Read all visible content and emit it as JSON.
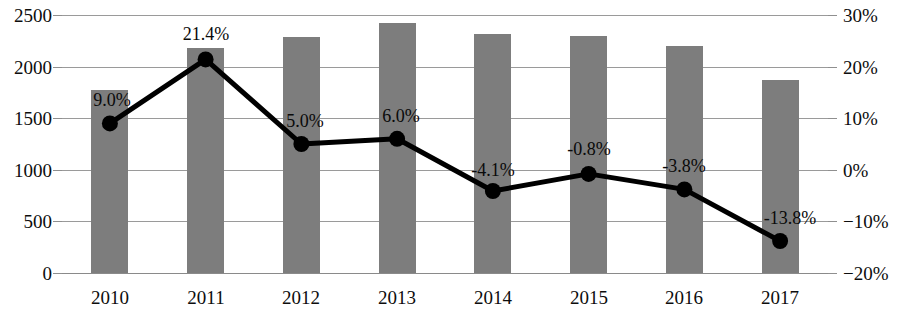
{
  "chart_data": {
    "type": "bar",
    "title": "",
    "subtitle": "",
    "xlabel": "",
    "ylabel": "",
    "y2label": "",
    "grid": true,
    "legend": "none",
    "categories": [
      "2010",
      "2011",
      "2012",
      "2013",
      "2014",
      "2015",
      "2016",
      "2017"
    ],
    "series": [
      {
        "name": "Amount",
        "type": "bar",
        "axis": "left",
        "color": "#7d7d7d",
        "values": [
          1769,
          2183,
          2288,
          2423,
          2317,
          2298,
          2202,
          1875
        ]
      },
      {
        "name": "Growth rate",
        "type": "line",
        "axis": "right",
        "color": "#000000",
        "values": [
          9.0,
          21.4,
          5.0,
          6.0,
          -4.1,
          -0.8,
          -3.8,
          -13.8
        ],
        "labels": [
          "9.0%",
          "21.4%",
          "5.0%",
          "6.0%",
          "-4.1%",
          "-0.8%",
          "-3.8%",
          "-13.8%"
        ]
      }
    ],
    "ylim": [
      0,
      2500
    ],
    "yticks": [
      0,
      500,
      1000,
      1500,
      2000,
      2500
    ],
    "ytick_labels": [
      "0",
      "500",
      "1000",
      "1500",
      "2000",
      "2500"
    ],
    "y2lim": [
      -20,
      30
    ],
    "y2ticks": [
      -20,
      -10,
      0,
      10,
      20,
      30
    ],
    "y2tick_labels": [
      "−20%",
      "−10%",
      "0%",
      "10%",
      "20%",
      "30%"
    ]
  },
  "colors": {
    "bar": "#7d7d7d",
    "line": "#000000",
    "grid": "#9a9a9a",
    "text": "#0d0d0d",
    "background": "#ffffff"
  }
}
